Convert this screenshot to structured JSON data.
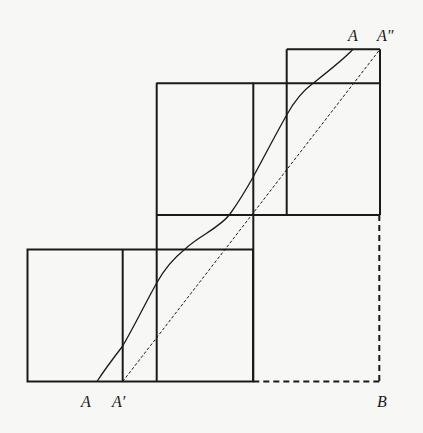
{
  "diagram": {
    "colors": {
      "background": "#f7f7f5",
      "stroke": "#1a1a1a"
    },
    "labels": {
      "bottom_a": "A",
      "bottom_a_prime": "A′",
      "corner_b": "B",
      "top_a": "A",
      "top_a_double_prime": "A″"
    }
  }
}
